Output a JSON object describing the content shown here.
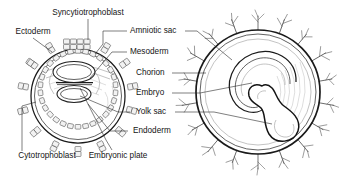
{
  "figure": {
    "background_color": "#ffffff",
    "line_color": "#1a1a1a",
    "text_color": "#141414",
    "width": 339,
    "height": 181
  },
  "labels": {
    "syncytiotrophoblast": "Syncytiotrophoblast",
    "ectoderm": "Ectoderm",
    "amniotic_sac": "Amniotic sac",
    "mesoderm": "Mesoderm",
    "chorion": "Chorion",
    "embryo": "Embryo",
    "yolk_sac": "Yolk sac",
    "endoderm": "Endoderm",
    "cytotrophoblast": "Cytotrophoblast",
    "embryonic_plate": "Embryonic plate"
  },
  "diagrams": {
    "left": {
      "name": "blastocyst-cross-section",
      "parts": [
        "syncytiotrophoblast",
        "cytotrophoblast",
        "ectoderm",
        "mesoderm",
        "endoderm",
        "amniotic sac",
        "yolk sac",
        "embryonic plate"
      ]
    },
    "right": {
      "name": "chorionic-vesicle",
      "parts": [
        "chorion",
        "amniotic sac",
        "embryo",
        "yolk sac",
        "chorionic villi"
      ]
    }
  }
}
